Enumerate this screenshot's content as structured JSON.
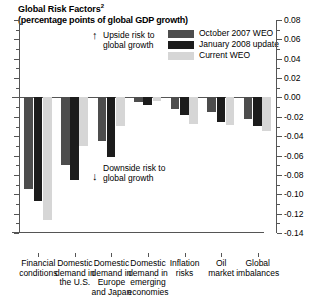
{
  "header": {
    "title": "Global Risk Factors",
    "title_superscript": "2",
    "subtitle": "(percentage points of global GDP growth)"
  },
  "legend": {
    "position": "top-right",
    "items": [
      {
        "label": "October 2007 WEO",
        "color": "#4d4d4d",
        "name": "october-2007-weo"
      },
      {
        "label": "January 2008 update",
        "color": "#1c1c1c",
        "name": "january-2008-update"
      },
      {
        "label": "Current WEO",
        "color": "#d6d6d6",
        "name": "current-weo"
      }
    ]
  },
  "annotations": [
    {
      "id": "upside",
      "arrow": "↑",
      "line1": "Upside risk to",
      "line2": "global growth"
    },
    {
      "id": "downside",
      "arrow": "↓",
      "line1": "Downside risk to",
      "line2": "global growth"
    }
  ],
  "chart_data": {
    "type": "bar",
    "title": "Global Risk Factors",
    "subtitle": "(percentage points of global GDP growth)",
    "xlabel": "",
    "ylabel": "percentage points of global GDP growth",
    "ylim": [
      -0.14,
      0.08
    ],
    "ytick_step_major": 0.02,
    "ytick_step_minor": 0.01,
    "yaxis_side": "right",
    "grid": false,
    "legend_position": "top-right",
    "categories": [
      "Financial\nconditions",
      "Domestic\ndemand in\nthe U.S.",
      "Domestic\ndemand in\nEurope\nand Japan",
      "Domestic\ndemand in\nemerging\neconomies",
      "Inflation\nrisks",
      "Oil\nmarket",
      "Global\nimbalances"
    ],
    "yticks": [
      "0.08",
      "0.06",
      "0.04",
      "0.02",
      "0.00",
      "-0.02",
      "-0.04",
      "-0.06",
      "-0.08",
      "-0.10",
      "-0.12",
      "-0.14"
    ],
    "series": [
      {
        "name": "October 2007 WEO",
        "color": "#4d4d4d",
        "values": [
          -0.095,
          -0.07,
          -0.045,
          -0.005,
          -0.012,
          -0.015,
          -0.022
        ]
      },
      {
        "name": "January 2008 update",
        "color": "#1c1c1c",
        "values": [
          -0.107,
          -0.085,
          -0.062,
          -0.008,
          -0.018,
          -0.025,
          -0.03
        ]
      },
      {
        "name": "Current WEO",
        "color": "#d6d6d6",
        "values": [
          -0.127,
          -0.05,
          -0.03,
          -0.004,
          -0.027,
          -0.028,
          -0.035
        ]
      }
    ]
  }
}
